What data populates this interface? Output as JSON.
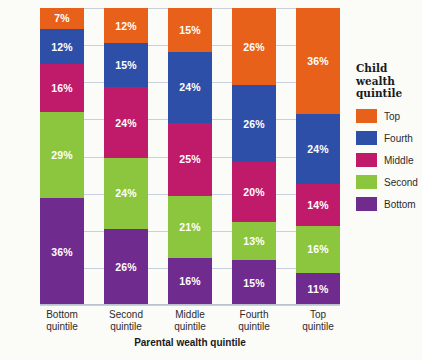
{
  "chart_data": {
    "type": "bar",
    "subtype": "stacked-bar-100",
    "title": "",
    "xlabel": "Parental wealth quintile",
    "ylabel": "",
    "ylim": [
      0,
      100
    ],
    "grid": true,
    "gridline_count": 8,
    "legend_position": "right",
    "legend_title": "Child wealth quintile",
    "categories": [
      "Bottom quintile",
      "Second quintile",
      "Middle quintile",
      "Fourth quintile",
      "Top quintile"
    ],
    "series": [
      {
        "name": "Bottom",
        "color": "#702B8E",
        "values": [
          36,
          26,
          16,
          15,
          11
        ],
        "labels": [
          "36%",
          "26%",
          "16%",
          "15%",
          "11%"
        ]
      },
      {
        "name": "Second",
        "color": "#8CC63E",
        "values": [
          29,
          24,
          21,
          13,
          16
        ],
        "labels": [
          "29%",
          "24%",
          "21%",
          "13%",
          "16%"
        ]
      },
      {
        "name": "Middle",
        "color": "#C01A6B",
        "values": [
          16,
          24,
          25,
          20,
          14
        ],
        "labels": [
          "16%",
          "24%",
          "25%",
          "20%",
          "14%"
        ]
      },
      {
        "name": "Fourth",
        "color": "#2E4FA8",
        "values": [
          12,
          15,
          24,
          26,
          24
        ],
        "labels": [
          "12%",
          "15%",
          "24%",
          "26%",
          "24%"
        ]
      },
      {
        "name": "Top",
        "color": "#E8611A",
        "values": [
          7,
          12,
          15,
          26,
          36
        ],
        "labels": [
          "7%",
          "12%",
          "15%",
          "26%",
          "36%"
        ]
      }
    ]
  },
  "legend": {
    "title_lines": [
      "Child",
      "wealth",
      "quintile"
    ],
    "entries": [
      {
        "label": "Top",
        "color": "#E8611A"
      },
      {
        "label": "Fourth",
        "color": "#2E4FA8"
      },
      {
        "label": "Middle",
        "color": "#C01A6B"
      },
      {
        "label": "Second",
        "color": "#8CC63E"
      },
      {
        "label": "Bottom",
        "color": "#702B8E"
      }
    ]
  },
  "axis": {
    "x_title": "Parental wealth quintile",
    "x_tick_lines": [
      [
        "Bottom",
        "quintile"
      ],
      [
        "Second",
        "quintile"
      ],
      [
        "Middle",
        "quintile"
      ],
      [
        "Fourth",
        "quintile"
      ],
      [
        "Top",
        "quintile"
      ]
    ]
  }
}
